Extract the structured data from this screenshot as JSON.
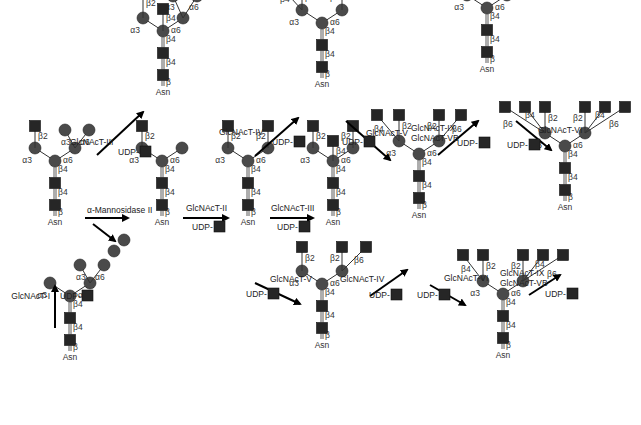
{
  "colors": {
    "mannose": "#4a4a4a",
    "glcnac": "#262626",
    "arrow": "#000000",
    "text": "#333333",
    "background": "#ffffff"
  },
  "legend_symbols": {
    "circle": "mannose-icon",
    "square": "glcnac-icon"
  },
  "common": {
    "asn": "Asn",
    "udp": "UDP-"
  },
  "glycans": [
    {
      "id": "g1",
      "name": "Man5GlcNAc2",
      "x": 70,
      "y": 360,
      "linkages": [
        "α3",
        "α6",
        "α3",
        "α6",
        "β4",
        "β4",
        "β"
      ]
    },
    {
      "id": "g2",
      "name": "GlcNAcMan5GlcNAc2",
      "x": 55,
      "y": 225,
      "linkages": [
        "β2",
        "α3",
        "α6",
        "α3",
        "α6",
        "β4",
        "β4",
        "β"
      ]
    },
    {
      "id": "g3",
      "name": "GlcNAcMan3GlcNAc2",
      "x": 162,
      "y": 225,
      "linkages": [
        "β2",
        "α3",
        "α6",
        "β4",
        "β4",
        "β"
      ]
    },
    {
      "id": "g4",
      "name": "bisected hybrid",
      "x": 163,
      "y": 95,
      "linkages": [
        "β2",
        "α3",
        "α6",
        "β4",
        "α3",
        "α6",
        "β4",
        "β4",
        "β"
      ]
    },
    {
      "id": "g5",
      "name": "biantennary",
      "x": 248,
      "y": 225,
      "linkages": [
        "β2",
        "β2",
        "α3",
        "α6",
        "β4",
        "β4",
        "β"
      ]
    },
    {
      "id": "g6",
      "name": "bisected biantennary",
      "x": 333,
      "y": 225,
      "linkages": [
        "β2",
        "β4",
        "β2",
        "α3",
        "α6",
        "β4",
        "β4",
        "β"
      ]
    },
    {
      "id": "g7",
      "name": "triantennary 2,4",
      "x": 322,
      "y": 87,
      "linkages": [
        "β4",
        "β2",
        "β2",
        "α3",
        "α6",
        "β4",
        "β4",
        "β"
      ]
    },
    {
      "id": "g8",
      "name": "triantennary 2,6",
      "x": 322,
      "y": 348,
      "linkages": [
        "β2",
        "β2",
        "β6",
        "α3",
        "α6",
        "β4",
        "β4",
        "β"
      ]
    },
    {
      "id": "g9",
      "name": "tetraantennary",
      "x": 419,
      "y": 218,
      "linkages": [
        "β4",
        "β2",
        "β2",
        "β6",
        "α3",
        "α6",
        "β4",
        "β4",
        "β"
      ]
    },
    {
      "id": "g10",
      "name": "pentaantennary 2,4,2,6 + β6",
      "x": 487,
      "y": 72,
      "linkages": [
        "β6",
        "β4",
        "β2",
        "β2",
        "β6",
        "α3",
        "α6",
        "β4",
        "β4",
        "β"
      ]
    },
    {
      "id": "g11",
      "name": "pentaantennary 4,2,2,4,6",
      "x": 503,
      "y": 358,
      "linkages": [
        "β4",
        "β2",
        "β2",
        "β4",
        "β6",
        "α3",
        "α6",
        "β4",
        "β4",
        "β"
      ]
    },
    {
      "id": "g12",
      "name": "hexaantennary",
      "x": 565,
      "y": 210,
      "linkages": [
        "β6",
        "β4",
        "β2",
        "β2",
        "β4",
        "β6",
        "α3",
        "α6",
        "β4",
        "β4",
        "β"
      ]
    }
  ],
  "reactions": [
    {
      "id": "r1",
      "enzyme": "GlcNAcT-I",
      "from": "g1",
      "to": "g2",
      "udp": true
    },
    {
      "id": "r2",
      "enzyme": "α-Mannosidase II",
      "from": "g2",
      "to": "g3",
      "udp": false,
      "byproduct": "2 mannose"
    },
    {
      "id": "r3",
      "enzyme": "GlcNAcT-III",
      "from": "g2",
      "to": "g4",
      "udp": true
    },
    {
      "id": "r4",
      "enzyme": "GlcNAcT-II",
      "from": "g3",
      "to": "g5",
      "udp": true
    },
    {
      "id": "r5",
      "enzyme": "GlcNAcT-III",
      "from": "g5",
      "to": "g6",
      "udp": true
    },
    {
      "id": "r6",
      "enzyme": "GlcNAcT-IV",
      "from": "g5",
      "to": "g7",
      "udp": true
    },
    {
      "id": "r7",
      "enzyme": "GlcNAcT-V",
      "from": "g5",
      "to": "g8",
      "udp": true
    },
    {
      "id": "r8",
      "enzyme": "GlcNAcT-V",
      "from": "g7",
      "to": "g9",
      "udp": true
    },
    {
      "id": "r9",
      "enzyme": "GlcNAcT-IV",
      "from": "g8",
      "to": "g9",
      "udp": true
    },
    {
      "id": "r10",
      "enzyme": "GlcNAcT-IX\nGlcNAcT-VB",
      "enzyme_lines": [
        "GlcNAcT-IX",
        "GlcNAcT-VB"
      ],
      "from": "g9",
      "to": "g10",
      "udp": true
    },
    {
      "id": "r11",
      "enzyme": "GlcNAcT-VI",
      "from": "g9",
      "to": "g11",
      "udp": true
    },
    {
      "id": "r12",
      "enzyme": "GlcNAcT-VI",
      "from": "g10",
      "to": "g12",
      "udp": true
    },
    {
      "id": "r13",
      "enzyme": "GlcNAcT-IX\nGlcNAcT-VB",
      "enzyme_lines": [
        "GlcNAcT-IX",
        "GlcNAcT-VB"
      ],
      "from": "g11",
      "to": "g12",
      "udp": true
    }
  ],
  "labels": {
    "gnt1": "GlcNAcT-I",
    "gnt2": "GlcNAcT-II",
    "gnt3a": "GlcNAcT-III",
    "gnt3b": "GlcNAcT-III",
    "gnt4a": "GlcNAcT-IV",
    "gnt4b": "GlcNAcT-IV",
    "gnt5a": "GlcNAcT-V",
    "gnt5b": "GlcNAcT-V",
    "gnt6a": "GlcNAcT-VI",
    "gnt6b": "GlcNAcT-VI",
    "gnt9": "GlcNAcT-IX",
    "gnt5vb": "GlcNAcT-VB",
    "mann2": "α-Mannosidase II"
  }
}
